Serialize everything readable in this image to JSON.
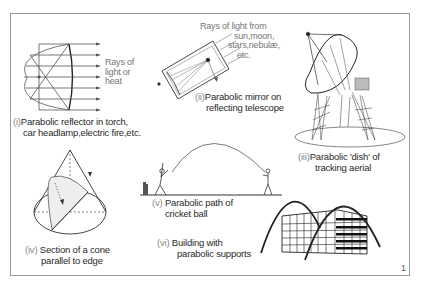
{
  "figure_number": "1",
  "panels": [
    {
      "id": "i",
      "numeral": "(i)",
      "caption_line1": "Parabolic reflector in torch,",
      "caption_line2": "car headlamp,electric fire,etc.",
      "annotation": [
        "Rays of",
        "light or",
        "heat"
      ]
    },
    {
      "id": "ii",
      "numeral": "(ii)",
      "caption_line1": "Parabolic mirror on",
      "caption_line2": "reflecting telescope",
      "annotation": [
        "Rays of light from",
        "sun,moon,",
        "stars,nebulæ,",
        "etc."
      ]
    },
    {
      "id": "iii",
      "numeral": "(iii)",
      "caption_line1": "Parabolic 'dish' of",
      "caption_line2": "tracking aerial"
    },
    {
      "id": "iv",
      "numeral": "(iv)",
      "caption_line1": "Section of a cone",
      "caption_line2": "parallel to edge"
    },
    {
      "id": "v",
      "numeral": "(v)",
      "caption_line1": "Parabolic path of",
      "caption_line2": "cricket ball"
    },
    {
      "id": "vi",
      "numeral": "(vi)",
      "caption_line1": "Building with",
      "caption_line2": "parabolic supports"
    }
  ]
}
